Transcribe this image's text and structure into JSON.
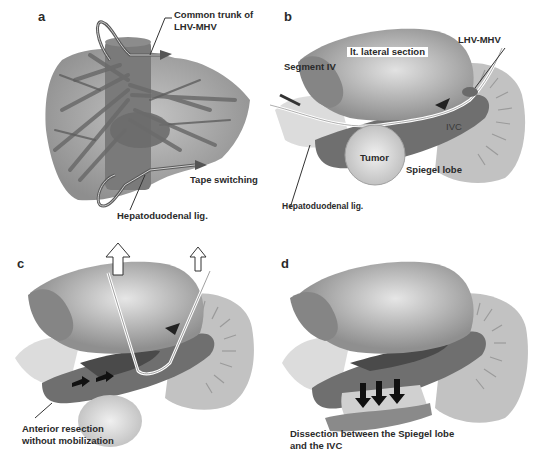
{
  "figure": {
    "panels": [
      {
        "letter": "a",
        "labels": {
          "common_trunk_line1": "Common trunk of",
          "common_trunk_line2": "LHV-MHV",
          "tape_switching": "Tape switching",
          "hepatoduodenal": "Hepatoduodenal lig."
        }
      },
      {
        "letter": "b",
        "labels": {
          "lt_lateral_section": "lt. lateral section",
          "segment_iv": "Segment IV",
          "lhv_mhv": "LHV-MHV",
          "ivc": "IVC",
          "tumor": "Tumor",
          "spiegel_lobe": "Spiegel lobe",
          "hepatoduodenal": "Hepatoduodenal lig."
        }
      },
      {
        "letter": "c",
        "labels": {
          "caption_line1": "Anterior resection",
          "caption_line2": "without mobilization"
        }
      },
      {
        "letter": "d",
        "labels": {
          "caption_line1": "Dissection between the Spiegel lobe",
          "caption_line2": "and the IVC"
        }
      }
    ],
    "colors": {
      "background": "#ffffff",
      "liver_dark": "#8a8a8a",
      "liver_mid": "#a8a8a8",
      "liver_light": "#d8d8d8",
      "ivc": "#6e6e6e",
      "label_text": "#2a2a2a"
    }
  }
}
